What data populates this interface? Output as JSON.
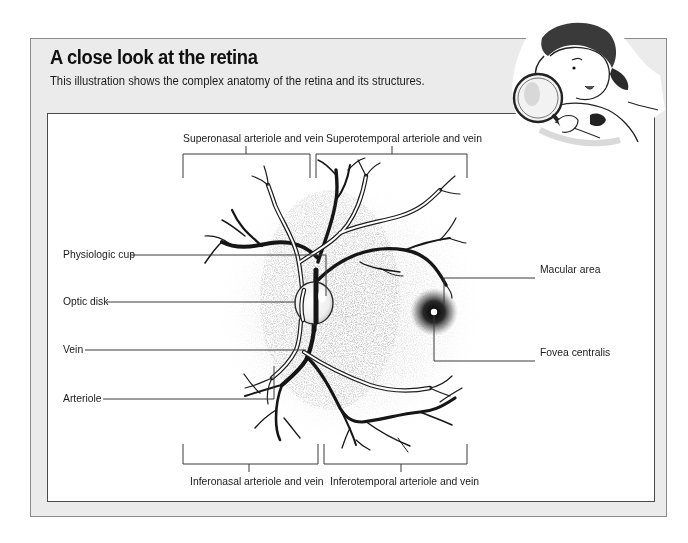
{
  "header": {
    "title": "A close look at the retina",
    "subtitle": "This illustration shows the complex anatomy of the retina and its structures."
  },
  "diagram": {
    "subject": "retina",
    "labels": {
      "superonasal": "Superonasal arteriole and vein",
      "superotemporal": "Superotemporal arteriole and vein",
      "inferonasal": "Inferonasal arteriole and vein",
      "inferotemporal": "Inferotemporal arteriole and vein",
      "physiologic_cup": "Physiologic cup",
      "optic_disk": "Optic disk",
      "vein": "Vein",
      "arteriole": "Arteriole",
      "macular_area": "Macular area",
      "fovea_centralis": "Fovea centralis"
    }
  },
  "decoration": {
    "mascot": "girl-with-magnifying-glass"
  },
  "colors": {
    "outer_background": "#ebebeb",
    "outer_border": "#8a8a8a",
    "inner_background": "#ffffff",
    "inner_border": "#4a4a4a",
    "vessel": "#161616",
    "leader_line": "#3a3a3a"
  }
}
